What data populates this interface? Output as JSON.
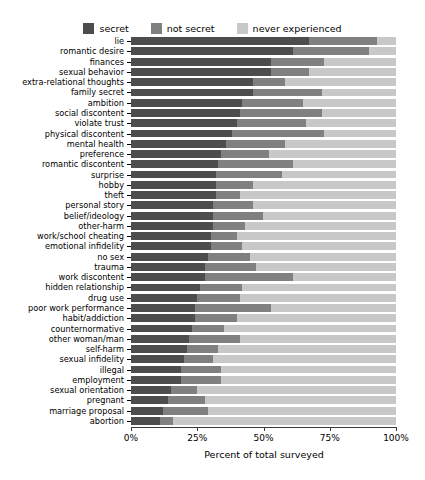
{
  "chart_data": {
    "type": "bar",
    "subtype": "stacked-horizontal-bar",
    "title": "",
    "xlabel": "Percent of total surveyed",
    "ylabel": "",
    "xlim": [
      0,
      100
    ],
    "xticks": [
      "0%",
      "25%",
      "50%",
      "75%",
      "100%"
    ],
    "xtick_values": [
      0,
      25,
      50,
      75,
      100
    ],
    "grid": false,
    "legend_position": "top-center",
    "stack_order": [
      "secret",
      "not secret",
      "never experienced"
    ],
    "colors": {
      "secret": "#4d4d4d",
      "not_secret": "#808080",
      "never_experienced": "#c8c8c8",
      "axis": "#3a3a3a",
      "background": "#ffffff",
      "text": "#000000"
    },
    "series": [
      {
        "name": "secret",
        "label": "secret",
        "color": "#4d4d4d"
      },
      {
        "name": "not secret",
        "label": "not secret",
        "color": "#808080"
      },
      {
        "name": "never experienced",
        "label": "never experienced",
        "color": "#c8c8c8"
      }
    ],
    "categories": [
      "lie",
      "romantic desire",
      "finances",
      "sexual behavior",
      "extra-relational thoughts",
      "family secret",
      "ambition",
      "social discontent",
      "violate trust",
      "physical discontent",
      "mental health",
      "preference",
      "romantic discontent",
      "surprise",
      "hobby",
      "theft",
      "personal story",
      "belief/ideology",
      "other-harm",
      "work/school cheating",
      "emotional infidelity",
      "no sex",
      "trauma",
      "work discontent",
      "hidden relationship",
      "drug use",
      "poor work performance",
      "habit/addiction",
      "counternormative",
      "other woman/man",
      "self-harm",
      "sexual infidelity",
      "illegal",
      "employment",
      "sexual orientation",
      "pregnant",
      "marriage proposal",
      "abortion"
    ],
    "rows": [
      {
        "category": "lie",
        "secret": 67,
        "not_secret": 26,
        "never_experienced": 7
      },
      {
        "category": "romantic desire",
        "secret": 61,
        "not_secret": 29,
        "never_experienced": 10
      },
      {
        "category": "finances",
        "secret": 53,
        "not_secret": 20,
        "never_experienced": 27
      },
      {
        "category": "sexual behavior",
        "secret": 53,
        "not_secret": 14,
        "never_experienced": 33
      },
      {
        "category": "extra-relational thoughts",
        "secret": 46,
        "not_secret": 12,
        "never_experienced": 42
      },
      {
        "category": "family secret",
        "secret": 46,
        "not_secret": 26,
        "never_experienced": 28
      },
      {
        "category": "ambition",
        "secret": 42,
        "not_secret": 23,
        "never_experienced": 35
      },
      {
        "category": "social discontent",
        "secret": 41,
        "not_secret": 31,
        "never_experienced": 28
      },
      {
        "category": "violate trust",
        "secret": 40,
        "not_secret": 26,
        "never_experienced": 34
      },
      {
        "category": "physical discontent",
        "secret": 38,
        "not_secret": 35,
        "never_experienced": 27
      },
      {
        "category": "mental health",
        "secret": 36,
        "not_secret": 22,
        "never_experienced": 42
      },
      {
        "category": "preference",
        "secret": 34,
        "not_secret": 18,
        "never_experienced": 48
      },
      {
        "category": "romantic discontent",
        "secret": 33,
        "not_secret": 28,
        "never_experienced": 39
      },
      {
        "category": "surprise",
        "secret": 32,
        "not_secret": 25,
        "never_experienced": 43
      },
      {
        "category": "hobby",
        "secret": 32,
        "not_secret": 14,
        "never_experienced": 54
      },
      {
        "category": "theft",
        "secret": 32,
        "not_secret": 9,
        "never_experienced": 59
      },
      {
        "category": "personal story",
        "secret": 31,
        "not_secret": 15,
        "never_experienced": 54
      },
      {
        "category": "belief/ideology",
        "secret": 31,
        "not_secret": 19,
        "never_experienced": 50
      },
      {
        "category": "other-harm",
        "secret": 31,
        "not_secret": 12,
        "never_experienced": 57
      },
      {
        "category": "work/school cheating",
        "secret": 30,
        "not_secret": 10,
        "never_experienced": 60
      },
      {
        "category": "emotional infidelity",
        "secret": 30,
        "not_secret": 12,
        "never_experienced": 58
      },
      {
        "category": "no sex",
        "secret": 29,
        "not_secret": 16,
        "never_experienced": 55
      },
      {
        "category": "trauma",
        "secret": 28,
        "not_secret": 19,
        "never_experienced": 53
      },
      {
        "category": "work discontent",
        "secret": 28,
        "not_secret": 33,
        "never_experienced": 39
      },
      {
        "category": "hidden relationship",
        "secret": 26,
        "not_secret": 16,
        "never_experienced": 58
      },
      {
        "category": "drug use",
        "secret": 25,
        "not_secret": 16,
        "never_experienced": 59
      },
      {
        "category": "poor work performance",
        "secret": 24,
        "not_secret": 29,
        "never_experienced": 47
      },
      {
        "category": "habit/addiction",
        "secret": 24,
        "not_secret": 16,
        "never_experienced": 60
      },
      {
        "category": "counternormative",
        "secret": 23,
        "not_secret": 12,
        "never_experienced": 65
      },
      {
        "category": "other woman/man",
        "secret": 22,
        "not_secret": 19,
        "never_experienced": 59
      },
      {
        "category": "self-harm",
        "secret": 21,
        "not_secret": 12,
        "never_experienced": 67
      },
      {
        "category": "sexual infidelity",
        "secret": 20,
        "not_secret": 11,
        "never_experienced": 69
      },
      {
        "category": "illegal",
        "secret": 19,
        "not_secret": 15,
        "never_experienced": 66
      },
      {
        "category": "employment",
        "secret": 19,
        "not_secret": 15,
        "never_experienced": 66
      },
      {
        "category": "sexual orientation",
        "secret": 15,
        "not_secret": 10,
        "never_experienced": 75
      },
      {
        "category": "pregnant",
        "secret": 14,
        "not_secret": 14,
        "never_experienced": 72
      },
      {
        "category": "marriage proposal",
        "secret": 12,
        "not_secret": 17,
        "never_experienced": 71
      },
      {
        "category": "abortion",
        "secret": 11,
        "not_secret": 5,
        "never_experienced": 84
      }
    ]
  },
  "legend": {
    "items": [
      {
        "label": "secret",
        "color": "#4d4d4d"
      },
      {
        "label": "not secret",
        "color": "#808080"
      },
      {
        "label": "never experienced",
        "color": "#c8c8c8"
      }
    ]
  },
  "axes": {
    "x_title": "Percent of total surveyed",
    "x_ticks": [
      "0%",
      "25%",
      "50%",
      "75%",
      "100%"
    ]
  }
}
